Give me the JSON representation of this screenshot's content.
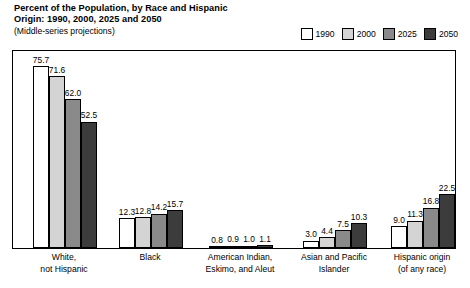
{
  "header": {
    "title_line1": "Percent of the Population, by Race and Hispanic",
    "title_line2": "Origin: 1990, 2000, 2025 and 2050",
    "subtitle": "(Middle-series projections)"
  },
  "legend": {
    "position": "top-right",
    "entries": [
      {
        "label": "1990",
        "color": "#ffffff"
      },
      {
        "label": "2000",
        "color": "#d4d4d4"
      },
      {
        "label": "2025",
        "color": "#8a8a8a"
      },
      {
        "label": "2050",
        "color": "#3c3c3c"
      }
    ]
  },
  "chart_data": {
    "type": "bar",
    "title": "Percent of the Population, by Race and Hispanic Origin: 1990, 2000, 2025 and 2050",
    "subtitle": "(Middle-series projections)",
    "xlabel": "",
    "ylabel": "",
    "ylim": [
      0,
      82
    ],
    "grid": false,
    "legend_position": "top-right",
    "categories": [
      "White,\nnot Hispanic",
      "Black",
      "American Indian,\nEskimo, and Aleut",
      "Asian and Pacific\nIslander",
      "Hispanic origin\n(of any race)"
    ],
    "category_lines": [
      [
        "White,",
        "not Hispanic"
      ],
      [
        "Black",
        ""
      ],
      [
        "American Indian,",
        "Eskimo, and Aleut"
      ],
      [
        "Asian and Pacific",
        "Islander"
      ],
      [
        "Hispanic origin",
        "(of any race)"
      ]
    ],
    "series": [
      {
        "name": "1990",
        "color": "#ffffff",
        "values": [
          75.7,
          12.3,
          0.8,
          3.0,
          9.0
        ],
        "labels": [
          "75.7",
          "12.3",
          "0.8",
          "3.0",
          "9.0"
        ]
      },
      {
        "name": "2000",
        "color": "#d4d4d4",
        "values": [
          71.6,
          12.8,
          0.9,
          4.4,
          11.3
        ],
        "labels": [
          "71.6",
          "12.8",
          "0.9",
          "4.4",
          "11.3"
        ]
      },
      {
        "name": "2025",
        "color": "#8a8a8a",
        "values": [
          62.0,
          14.2,
          1.0,
          7.5,
          16.8
        ],
        "labels": [
          "62.0",
          "14.2",
          "1.0",
          "7.5",
          "16.8"
        ]
      },
      {
        "name": "2050",
        "color": "#3c3c3c",
        "values": [
          52.5,
          15.7,
          1.1,
          10.3,
          22.5
        ],
        "labels": [
          "52.5",
          "15.7",
          "1.1",
          "10.3",
          "22.5"
        ]
      }
    ]
  }
}
